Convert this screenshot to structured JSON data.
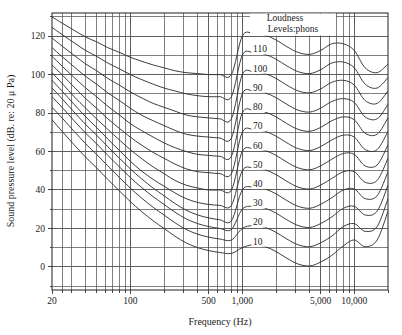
{
  "chart_data": {
    "type": "line",
    "title": "",
    "xlabel": "Frequency (Hz)",
    "ylabel": "Sound pressure level (dB. re: 20 μ Pa)",
    "legend_title_line1": "Loudness",
    "legend_title_line2": "Levels:phons",
    "legend_position": "inside-top-center",
    "grid": true,
    "x_scale": "log",
    "y_scale": "linear",
    "xlim": [
      20,
      20000
    ],
    "ylim": [
      -12,
      132
    ],
    "x_tick_labels": [
      "20",
      "100",
      "500",
      "1,000",
      "5,000",
      "10,000"
    ],
    "x_tick_values": [
      20,
      100,
      500,
      1000,
      5000,
      10000
    ],
    "x_gridline_values": [
      20,
      25,
      30,
      40,
      50,
      60,
      70,
      80,
      90,
      100,
      200,
      300,
      400,
      500,
      600,
      700,
      800,
      900,
      1000,
      2000,
      3000,
      4000,
      5000,
      6000,
      7000,
      8000,
      9000,
      10000,
      20000
    ],
    "y_tick_labels": [
      "0",
      "20",
      "40",
      "60",
      "80",
      "100",
      "120"
    ],
    "y_tick_values": [
      0,
      20,
      40,
      60,
      80,
      100,
      120
    ],
    "y_gridline_values": [
      -10,
      0,
      10,
      20,
      30,
      40,
      50,
      60,
      70,
      80,
      90,
      100,
      110,
      120,
      130
    ],
    "line_color": "#333333",
    "grid_color": "#555555",
    "frame_color": "#333333",
    "x": [
      20,
      25,
      31.5,
      40,
      50,
      63,
      80,
      100,
      125,
      160,
      200,
      250,
      315,
      400,
      500,
      630,
      800,
      1000,
      1250,
      1600,
      2000,
      2500,
      3150,
      4000,
      5000,
      6300,
      8000,
      10000,
      12500,
      16000,
      20000
    ],
    "series": [
      {
        "name": "10",
        "label": "10",
        "values": [
          76.5,
          70.0,
          63.5,
          57.0,
          51.5,
          45.5,
          39.5,
          34.0,
          29.0,
          24.0,
          20.0,
          16.0,
          12.5,
          10.0,
          8.5,
          7.5,
          7.0,
          10.0,
          11.5,
          10.5,
          8.0,
          4.5,
          1.5,
          0.5,
          2.5,
          6.0,
          11.0,
          14.0,
          10.5,
          14.0,
          29.0
        ]
      },
      {
        "name": "20",
        "label": "20",
        "values": [
          83.0,
          77.0,
          70.5,
          64.0,
          58.5,
          52.5,
          46.5,
          41.0,
          36.0,
          31.0,
          27.0,
          23.0,
          19.5,
          17.0,
          15.5,
          14.5,
          14.0,
          20.0,
          21.5,
          20.5,
          18.0,
          14.5,
          11.5,
          10.5,
          12.5,
          16.0,
          21.0,
          22.5,
          18.5,
          21.0,
          35.5
        ]
      },
      {
        "name": "30",
        "label": "30",
        "values": [
          88.5,
          82.5,
          76.0,
          69.5,
          64.0,
          58.0,
          52.0,
          46.5,
          41.5,
          36.5,
          32.5,
          28.5,
          25.0,
          22.5,
          21.0,
          20.0,
          19.5,
          30.0,
          31.5,
          30.5,
          28.0,
          24.5,
          21.5,
          20.5,
          22.5,
          26.0,
          30.5,
          31.5,
          27.0,
          29.0,
          42.5
        ]
      },
      {
        "name": "40",
        "label": "40",
        "values": [
          93.0,
          87.0,
          80.5,
          74.0,
          68.5,
          62.5,
          56.5,
          51.0,
          46.0,
          41.0,
          37.0,
          33.0,
          29.5,
          27.0,
          25.5,
          24.5,
          24.0,
          40.0,
          41.5,
          40.5,
          38.0,
          34.5,
          31.5,
          30.5,
          32.5,
          36.0,
          40.0,
          40.5,
          35.5,
          37.0,
          49.5
        ]
      },
      {
        "name": "50",
        "label": "50",
        "values": [
          97.0,
          91.0,
          84.5,
          78.0,
          72.5,
          66.5,
          60.5,
          55.0,
          50.0,
          45.5,
          42.0,
          38.5,
          35.5,
          33.5,
          32.5,
          32.0,
          32.0,
          50.0,
          51.5,
          50.5,
          48.0,
          44.5,
          41.5,
          40.5,
          42.5,
          46.0,
          49.5,
          49.5,
          44.0,
          45.0,
          56.5
        ]
      },
      {
        "name": "60",
        "label": "60",
        "values": [
          101.0,
          95.0,
          88.5,
          82.5,
          77.0,
          71.5,
          66.0,
          61.0,
          56.5,
          52.0,
          48.5,
          45.0,
          42.5,
          41.0,
          40.0,
          40.0,
          40.0,
          60.0,
          61.5,
          60.5,
          58.0,
          54.5,
          51.5,
          50.5,
          52.5,
          56.0,
          59.0,
          58.5,
          52.5,
          53.0,
          63.5
        ]
      },
      {
        "name": "70",
        "label": "70",
        "values": [
          105.0,
          99.5,
          93.5,
          87.5,
          82.5,
          77.0,
          72.0,
          67.5,
          63.5,
          59.5,
          56.5,
          53.5,
          51.0,
          49.5,
          49.0,
          48.5,
          48.5,
          70.0,
          71.5,
          70.5,
          68.0,
          64.5,
          61.5,
          60.5,
          62.5,
          66.0,
          68.5,
          67.5,
          61.0,
          61.0,
          70.5
        ]
      },
      {
        "name": "80",
        "label": "80",
        "values": [
          109.5,
          104.0,
          98.5,
          93.0,
          88.5,
          83.5,
          79.0,
          74.5,
          71.0,
          67.5,
          64.5,
          62.0,
          60.0,
          58.5,
          58.0,
          57.5,
          57.5,
          80.0,
          81.5,
          80.5,
          78.0,
          74.5,
          71.5,
          70.5,
          72.5,
          76.0,
          78.0,
          76.5,
          69.5,
          69.0,
          77.5
        ]
      },
      {
        "name": "90",
        "label": "90",
        "values": [
          114.0,
          109.0,
          104.0,
          99.0,
          95.0,
          90.5,
          86.5,
          82.5,
          79.0,
          76.0,
          73.5,
          71.0,
          69.0,
          68.0,
          67.5,
          67.0,
          67.0,
          90.0,
          91.5,
          90.5,
          88.0,
          84.5,
          81.5,
          80.5,
          82.5,
          86.0,
          87.5,
          85.5,
          78.0,
          77.0,
          84.5
        ]
      },
      {
        "name": "100",
        "label": "100",
        "values": [
          119.0,
          114.5,
          110.0,
          105.5,
          102.0,
          98.0,
          94.5,
          91.0,
          88.0,
          85.0,
          83.0,
          81.0,
          79.0,
          78.0,
          77.5,
          77.0,
          77.0,
          100.0,
          101.5,
          100.5,
          98.0,
          94.5,
          91.5,
          90.5,
          92.5,
          96.0,
          97.0,
          94.5,
          86.5,
          85.0,
          91.5
        ]
      },
      {
        "name": "110",
        "label": "110",
        "values": [
          124.5,
          120.5,
          116.5,
          112.5,
          109.5,
          106.0,
          103.0,
          100.0,
          97.5,
          95.0,
          93.0,
          91.5,
          90.0,
          89.0,
          88.5,
          88.5,
          88.5,
          110.0,
          111.5,
          110.5,
          108.0,
          104.5,
          101.5,
          100.5,
          102.5,
          106.0,
          106.5,
          103.5,
          95.0,
          93.0,
          98.5
        ]
      },
      {
        "name": "120",
        "label": "120",
        "values": [
          130.0,
          126.5,
          123.0,
          119.5,
          117.0,
          114.0,
          111.5,
          109.0,
          107.0,
          105.0,
          103.5,
          102.0,
          101.0,
          100.5,
          100.0,
          100.0,
          100.0,
          120.0,
          121.5,
          120.5,
          118.0,
          114.5,
          111.5,
          110.5,
          112.5,
          116.0,
          116.0,
          112.5,
          103.5,
          101.0,
          105.5
        ]
      }
    ],
    "curve_label_values": [
      "120",
      "110",
      "100",
      "90",
      "80",
      "70",
      "60",
      "50",
      "40",
      "30",
      "20",
      "10"
    ]
  }
}
